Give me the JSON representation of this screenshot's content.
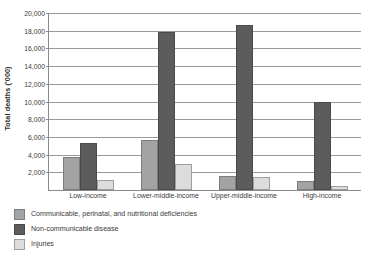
{
  "chart_data": {
    "type": "bar",
    "title": "",
    "xlabel": "",
    "ylabel": "Total deaths ('000)",
    "ylim": [
      0,
      20000
    ],
    "ytick_step": 2000,
    "ytick_labels": [
      "20,000",
      "18,000",
      "16,000",
      "14,000",
      "12,000",
      "10,000",
      "8,000",
      "6,000",
      "4,000",
      "2,000"
    ],
    "ytick_values": [
      20000,
      18000,
      16000,
      14000,
      12000,
      10000,
      8000,
      6000,
      4000,
      2000
    ],
    "grid": true,
    "legend_position": "below-left",
    "categories": [
      "Low-income",
      "Lower-middle-income",
      "Upper-middle-income",
      "High-income"
    ],
    "series": [
      {
        "name": "Communicable, perinatal, and nutritional deficiencies",
        "color": "#a3a3a3",
        "values": [
          3700,
          5700,
          1600,
          1000
        ]
      },
      {
        "name": "Non-communicable disease",
        "color": "#5c5c5c",
        "values": [
          5300,
          17850,
          18700,
          10000
        ]
      },
      {
        "name": "Injuries",
        "color": "#dcdcdc",
        "values": [
          1100,
          2900,
          1500,
          500
        ]
      }
    ]
  },
  "source_note": ""
}
